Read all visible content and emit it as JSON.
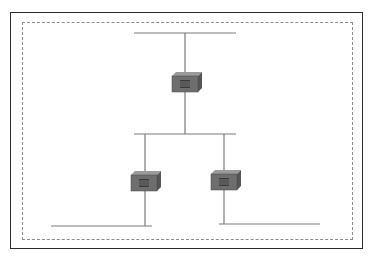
{
  "diagram": {
    "type": "network-topology",
    "colors": {
      "frame": "#2a2a2a",
      "boundary": "#8a8a8a",
      "line": "#7a7a7a",
      "device_front": "#6e6e6e",
      "device_top": "#9a9a9a",
      "device_side": "#555555",
      "device_grille": "#2a2a2a"
    },
    "nodes": [
      {
        "id": "switch-top",
        "type": "switch-icon",
        "x": 172,
        "y": 72
      },
      {
        "id": "switch-left",
        "type": "switch-icon",
        "x": 131,
        "y": 171
      },
      {
        "id": "switch-right",
        "type": "switch-icon",
        "x": 211,
        "y": 170
      }
    ],
    "segments": [
      {
        "id": "segment-top",
        "x1": 134,
        "y1": 33,
        "x2": 236,
        "y2": 33
      },
      {
        "id": "segment-middle",
        "x1": 134,
        "y1": 134,
        "x2": 236,
        "y2": 134
      },
      {
        "id": "segment-bottom-left",
        "x1": 51,
        "y1": 226,
        "x2": 152,
        "y2": 226
      },
      {
        "id": "segment-bottom-right",
        "x1": 219,
        "y1": 224,
        "x2": 320,
        "y2": 224
      }
    ],
    "links": [
      {
        "from": "segment-top",
        "to": "switch-top"
      },
      {
        "from": "switch-top",
        "to": "segment-middle"
      },
      {
        "from": "segment-middle",
        "to": "switch-left"
      },
      {
        "from": "segment-middle",
        "to": "switch-right"
      },
      {
        "from": "switch-left",
        "to": "segment-bottom-left"
      },
      {
        "from": "switch-right",
        "to": "segment-bottom-right"
      }
    ]
  }
}
